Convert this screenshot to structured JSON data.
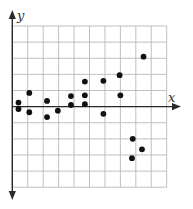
{
  "chart_data": {
    "type": "scatter",
    "title": "",
    "xlabel": "x",
    "ylabel": "y",
    "xlim": [
      0,
      10
    ],
    "ylim": [
      -5,
      5
    ],
    "grid": true,
    "legend": null,
    "tick_labels": false,
    "series": [
      {
        "name": "points",
        "color": "#111111",
        "points": [
          {
            "x": 0.4,
            "y": 0.25
          },
          {
            "x": 0.4,
            "y": -0.15
          },
          {
            "x": 1.1,
            "y": 0.85
          },
          {
            "x": 1.1,
            "y": -0.35
          },
          {
            "x": 2.25,
            "y": 0.35
          },
          {
            "x": 2.25,
            "y": -0.65
          },
          {
            "x": 2.95,
            "y": -0.25
          },
          {
            "x": 3.8,
            "y": 0.65
          },
          {
            "x": 3.8,
            "y": 0.1
          },
          {
            "x": 4.7,
            "y": 1.55
          },
          {
            "x": 4.7,
            "y": 0.7
          },
          {
            "x": 4.7,
            "y": 0.15
          },
          {
            "x": 5.9,
            "y": 1.6
          },
          {
            "x": 5.9,
            "y": -0.45
          },
          {
            "x": 6.95,
            "y": 1.95
          },
          {
            "x": 7.0,
            "y": 0.7
          },
          {
            "x": 8.5,
            "y": 3.1
          },
          {
            "x": 7.8,
            "y": -2.0
          },
          {
            "x": 8.4,
            "y": -2.65
          },
          {
            "x": 7.75,
            "y": -3.2
          }
        ]
      }
    ]
  },
  "axes": {
    "x_label": "x",
    "y_label": "y"
  },
  "colors": {
    "grid": "#b9b9b9",
    "axis": "#2a2a2a",
    "points": "#111111"
  }
}
